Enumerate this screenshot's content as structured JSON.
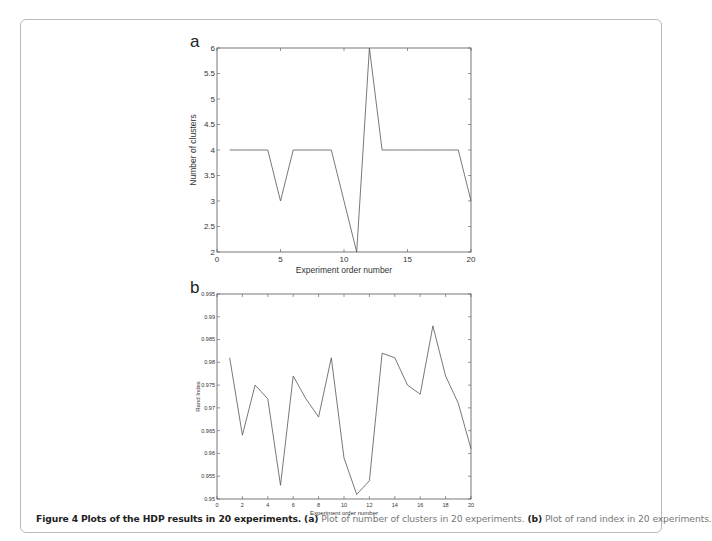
{
  "caption": {
    "figure_label": "Figure 4",
    "figure_title": "Plots of the HDP results in 20 experiments.",
    "part_a_label": "(a)",
    "part_a_text": "Plot of number of clusters in 20 experiments.",
    "part_b_label": "(b)",
    "part_b_text": "Plot of rand index in 20 experiments."
  },
  "chart_data": [
    {
      "type": "line",
      "panel_label": "a",
      "title": "",
      "xlabel": "Experiment order number",
      "ylabel": "Number of clusters",
      "xlim": [
        0,
        20
      ],
      "ylim": [
        2,
        6
      ],
      "xticks": [
        0,
        5,
        10,
        15,
        20
      ],
      "yticks": [
        2,
        2.5,
        3,
        3.5,
        4,
        4.5,
        5,
        5.5,
        6
      ],
      "x": [
        1,
        2,
        3,
        4,
        5,
        6,
        7,
        8,
        9,
        10,
        11,
        12,
        13,
        14,
        15,
        16,
        17,
        18,
        19,
        20
      ],
      "values": [
        4,
        4,
        4,
        4,
        3,
        4,
        4,
        4,
        4,
        3,
        2,
        6,
        4,
        4,
        4,
        4,
        4,
        4,
        4,
        3
      ],
      "grid": false,
      "line_color": "#555555"
    },
    {
      "type": "line",
      "panel_label": "b",
      "title": "",
      "xlabel": "Experiment order number",
      "ylabel": "Rand Index",
      "xlim": [
        0,
        20
      ],
      "ylim": [
        0.95,
        0.995
      ],
      "xticks": [
        0,
        2,
        4,
        6,
        8,
        10,
        12,
        14,
        16,
        18,
        20
      ],
      "yticks": [
        0.95,
        0.955,
        0.96,
        0.965,
        0.97,
        0.975,
        0.98,
        0.985,
        0.99,
        0.995
      ],
      "x": [
        1,
        2,
        3,
        4,
        5,
        6,
        7,
        8,
        9,
        10,
        11,
        12,
        13,
        14,
        15,
        16,
        17,
        18,
        19,
        20
      ],
      "values": [
        0.981,
        0.964,
        0.975,
        0.972,
        0.953,
        0.977,
        0.972,
        0.968,
        0.981,
        0.959,
        0.951,
        0.954,
        0.982,
        0.981,
        0.975,
        0.973,
        0.988,
        0.977,
        0.971,
        0.961
      ],
      "grid": false,
      "line_color": "#555555"
    }
  ]
}
